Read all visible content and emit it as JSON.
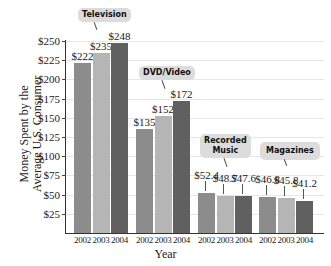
{
  "chart_data": {
    "type": "bar",
    "title": "",
    "xlabel": "Year",
    "ylabel": "Money Spent by the Average U.S. Consumer",
    "ylim": [
      0,
      250
    ],
    "yticks": [
      "$25",
      "$50",
      "$75",
      "$100",
      "$125",
      "$150",
      "$175",
      "$200",
      "$225",
      "$250"
    ],
    "categories": [
      "Television",
      "DVD/Video",
      "Recorded Music",
      "Magazines"
    ],
    "years": [
      "2002",
      "2003",
      "2004"
    ],
    "series": [
      {
        "name": "2002",
        "color": "#8c8c8c",
        "values": [
          222,
          135,
          52.4,
          46.8
        ],
        "labels": [
          "$222",
          "$135",
          "$52.4",
          "$46.8"
        ]
      },
      {
        "name": "2003",
        "color": "#b5b5b5",
        "values": [
          235,
          152,
          48.7,
          45.8
        ],
        "labels": [
          "$235",
          "$152",
          "$48.7",
          "$45.8"
        ]
      },
      {
        "name": "2004",
        "color": "#606060",
        "values": [
          248,
          172,
          47.6,
          41.2
        ],
        "labels": [
          "$248",
          "$172",
          "$47.6",
          "$41.2"
        ]
      }
    ],
    "grid": true,
    "legend": "none (category callouts)"
  },
  "labels": {
    "xlabel": "Year",
    "ylabel_line1": "Money Spent by the",
    "ylabel_line2": "Average U.S. Consumer",
    "cat_tv": "Television",
    "cat_dvd": "DVD/Video",
    "cat_music_1": "Recorded",
    "cat_music_2": "Music",
    "cat_mag": "Magazines"
  }
}
